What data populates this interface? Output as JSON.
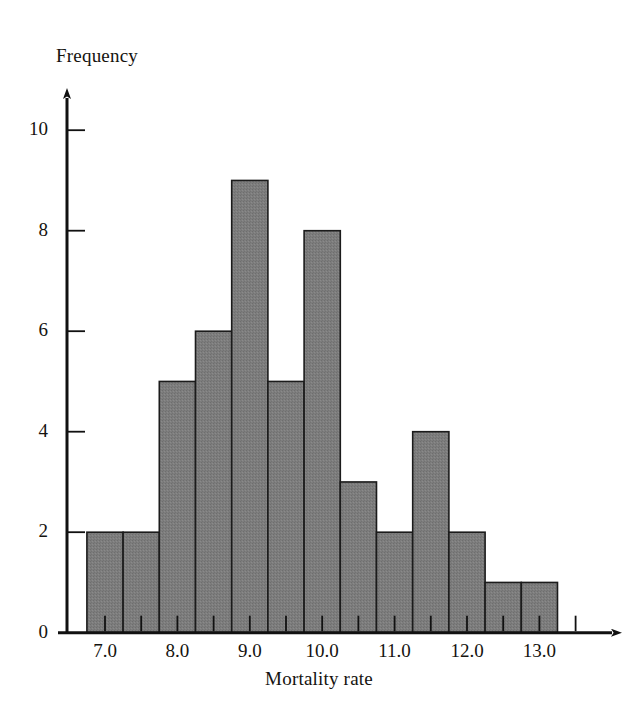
{
  "chart_data": {
    "type": "bar",
    "title": "",
    "subtitle": "",
    "xlabel": "Mortality rate",
    "ylabel": "Frequency",
    "categories": [
      "7.0",
      "7.5",
      "8.0",
      "8.5",
      "9.0",
      "9.5",
      "10.0",
      "10.5",
      "11.0",
      "11.5",
      "12.0",
      "12.5",
      "13.0"
    ],
    "bin_centers": [
      7.0,
      7.5,
      8.0,
      8.5,
      9.0,
      9.5,
      10.0,
      10.5,
      11.0,
      11.5,
      12.0,
      12.5,
      13.0
    ],
    "bin_width": 0.5,
    "values": [
      2,
      2,
      5,
      6,
      9,
      5,
      8,
      3,
      2,
      4,
      2,
      1,
      1
    ],
    "xlim": [
      6.75,
      13.65
    ],
    "ylim": [
      0,
      10.8
    ],
    "xticks_major": [
      "7.0",
      "8.0",
      "9.0",
      "10.0",
      "11.0",
      "12.0",
      "13.0"
    ],
    "xticks_major_values": [
      7.0,
      8.0,
      9.0,
      10.0,
      11.0,
      12.0,
      13.0
    ],
    "xticks_minor_values": [
      7.0,
      7.5,
      8.0,
      8.5,
      9.0,
      9.5,
      10.0,
      10.5,
      11.0,
      11.5,
      12.0,
      12.5,
      13.0,
      13.5
    ],
    "yticks": [
      "0",
      "2",
      "4",
      "6",
      "8",
      "10"
    ],
    "ytick_values": [
      0,
      2,
      4,
      6,
      8,
      10
    ],
    "grid": false,
    "legend": null,
    "bar_fill_color": "#7d7d7d",
    "bar_edge_color": "#1b1b1b",
    "axis_color": "#111111",
    "background_color": "#ffffff",
    "x_axis_has_arrow": true,
    "y_axis_has_arrow": true
  }
}
